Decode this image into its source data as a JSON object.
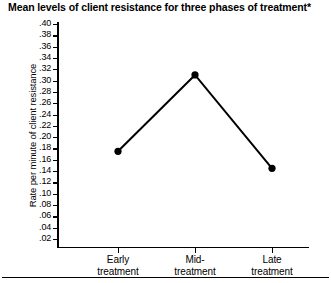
{
  "figure": {
    "title": "Mean levels of client resistance for three phases of treatment*",
    "bottom_rule": true
  },
  "chart_data": {
    "type": "line",
    "title": "Mean levels of client resistance for three phases of treatment*",
    "xlabel": "",
    "ylabel": "Rate per minute of client resistance",
    "categories": [
      "Early treatment",
      "Mid-treatment",
      "Late treatment"
    ],
    "category_lines": [
      [
        "Early",
        "treatment"
      ],
      [
        "Mid-",
        "treatment"
      ],
      [
        "Late",
        "treatment"
      ]
    ],
    "values": [
      0.175,
      0.31,
      0.145
    ],
    "ylim": [
      0.0,
      0.41
    ],
    "ytick_values": [
      0.4,
      0.38,
      0.36,
      0.34,
      0.32,
      0.3,
      0.28,
      0.26,
      0.24,
      0.22,
      0.2,
      0.18,
      0.16,
      0.14,
      0.12,
      0.1,
      0.08,
      0.06,
      0.04,
      0.02
    ],
    "ytick_labels": [
      ".40",
      ".38",
      ".36",
      ".34",
      ".32",
      ".30",
      ".28",
      ".26",
      ".24",
      ".22",
      ".20",
      ".18",
      ".16",
      ".14",
      ".12",
      ".10",
      ".08",
      ".06",
      ".04",
      ".02"
    ],
    "grid": false,
    "legend": null,
    "marker": "circle",
    "series_color": "#000000",
    "line_width": 2
  }
}
